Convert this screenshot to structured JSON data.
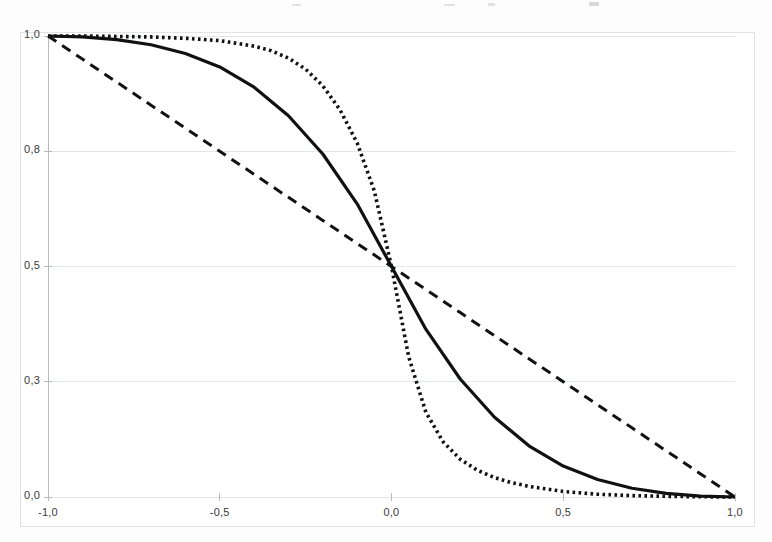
{
  "figure": {
    "background_color": "#fdfdfd",
    "plot_background_color": "#ffffff",
    "frame_color": "#e2e2e2",
    "gridline_color": "#dfe6ef",
    "axis_color": "#b9b9b9",
    "curve_color": "#111111",
    "tick_label_color": "#3a3a3a"
  },
  "chart_data": {
    "type": "line",
    "title": "",
    "subtitle": "",
    "xlabel": "",
    "ylabel": "",
    "xlim": [
      -1.0,
      1.0
    ],
    "ylim": [
      0.0,
      1.0
    ],
    "grid": true,
    "grid_axis": "y",
    "legend": null,
    "legend_position": "none",
    "x_tick_labels": [
      "-1,0",
      "-0,5",
      "0,0",
      "0,5",
      "1,0"
    ],
    "x_tick_values": [
      -1.0,
      -0.5,
      0.0,
      0.5,
      1.0
    ],
    "y_tick_labels": [
      "1,0",
      "0,8",
      "0,5",
      "0,3",
      "0,0"
    ],
    "y_tick_values": [
      1.0,
      0.8,
      0.5,
      0.3,
      0.0
    ],
    "annotations": [],
    "crossing_point": [
      0.0,
      0.5
    ],
    "series": [
      {
        "name": "linear",
        "style": "dashed",
        "dash_pattern": "10 7",
        "width": 3.0,
        "color": "#111111",
        "x": [
          -1.0,
          -0.9,
          -0.8,
          -0.7,
          -0.6,
          -0.5,
          -0.4,
          -0.3,
          -0.2,
          -0.1,
          0.0,
          0.1,
          0.2,
          0.3,
          0.4,
          0.5,
          0.6,
          0.7,
          0.8,
          0.9,
          1.0
        ],
        "values": [
          1.0,
          0.95,
          0.9,
          0.85,
          0.8,
          0.75,
          0.7,
          0.65,
          0.6,
          0.55,
          0.5,
          0.45,
          0.4,
          0.35,
          0.3,
          0.25,
          0.2,
          0.15,
          0.1,
          0.05,
          0.0
        ]
      },
      {
        "name": "moderate-sigmoid",
        "style": "solid",
        "dash_pattern": "",
        "width": 3.2,
        "color": "#111111",
        "x": [
          -1.0,
          -0.9,
          -0.8,
          -0.7,
          -0.6,
          -0.5,
          -0.4,
          -0.3,
          -0.2,
          -0.1,
          0.0,
          0.1,
          0.2,
          0.3,
          0.4,
          0.5,
          0.6,
          0.7,
          0.8,
          0.9,
          1.0
        ],
        "values": [
          1.0,
          0.998,
          0.992,
          0.981,
          0.962,
          0.933,
          0.889,
          0.827,
          0.744,
          0.636,
          0.5,
          0.364,
          0.256,
          0.173,
          0.111,
          0.067,
          0.038,
          0.019,
          0.008,
          0.002,
          0.0
        ]
      },
      {
        "name": "steep-sigmoid",
        "style": "dotted",
        "dash_pattern": "2.6 3.4",
        "width": 3.6,
        "color": "#111111",
        "x": [
          -1.0,
          -0.9,
          -0.8,
          -0.7,
          -0.6,
          -0.5,
          -0.4,
          -0.35,
          -0.3,
          -0.25,
          -0.2,
          -0.15,
          -0.1,
          -0.05,
          0.0,
          0.05,
          0.1,
          0.15,
          0.2,
          0.25,
          0.3,
          0.35,
          0.4,
          0.5,
          0.6,
          0.7,
          0.8,
          0.9,
          1.0
        ],
        "values": [
          1.0,
          1.0,
          0.999,
          0.998,
          0.995,
          0.99,
          0.978,
          0.968,
          0.952,
          0.928,
          0.892,
          0.84,
          0.768,
          0.664,
          0.5,
          0.304,
          0.184,
          0.12,
          0.082,
          0.058,
          0.042,
          0.031,
          0.023,
          0.012,
          0.006,
          0.003,
          0.0015,
          0.0005,
          0.0
        ]
      }
    ]
  }
}
